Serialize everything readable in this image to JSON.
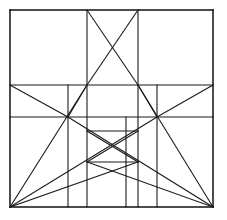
{
  "figure": {
    "title": "Geometric line construction diagram",
    "canvas": {
      "width": 227,
      "height": 220
    },
    "background_color": "#ffffff",
    "line_color": "#1a1a1a",
    "frame_color": "#111111",
    "line_width": 1.1,
    "frame_width": 1.5
  },
  "chart_data": {
    "type": "line",
    "title": "Geometric line construction diagram",
    "xlabel": "",
    "ylabel": "",
    "xlim": [
      0,
      227
    ],
    "ylim": [
      0,
      220
    ],
    "grid": false,
    "legend": "none",
    "bounds": {
      "left": 10,
      "top": 10,
      "right": 213,
      "bottom": 207
    },
    "vertical_rules": [
      10,
      68,
      87,
      126,
      138,
      157,
      213
    ],
    "horizontal_rules": [
      10,
      85,
      117,
      131,
      162,
      207
    ],
    "nodes": [
      {
        "name": "left-node",
        "x": 68,
        "y": 117
      },
      {
        "name": "right-node",
        "x": 157,
        "y": 117
      },
      {
        "name": "upper-left-node",
        "x": 87,
        "y": 85
      },
      {
        "name": "upper-right-node",
        "x": 138,
        "y": 85
      },
      {
        "name": "bottom-left-corner",
        "x": 10,
        "y": 207
      },
      {
        "name": "bottom-right-corner",
        "x": 213,
        "y": 207
      }
    ],
    "segments": [
      {
        "name": "frame-top",
        "x1": 10,
        "y1": 10,
        "x2": 213,
        "y2": 10,
        "kind": "frame"
      },
      {
        "name": "frame-right",
        "x1": 213,
        "y1": 10,
        "x2": 213,
        "y2": 207,
        "kind": "frame"
      },
      {
        "name": "frame-bottom",
        "x1": 10,
        "y1": 207,
        "x2": 213,
        "y2": 207,
        "kind": "frame"
      },
      {
        "name": "frame-left",
        "x1": 10,
        "y1": 10,
        "x2": 10,
        "y2": 207,
        "kind": "frame"
      },
      {
        "name": "horizontal-upper",
        "x1": 10,
        "y1": 85,
        "x2": 213,
        "y2": 85,
        "kind": "rule"
      },
      {
        "name": "horizontal-mid",
        "x1": 10,
        "y1": 117,
        "x2": 213,
        "y2": 117,
        "kind": "rule"
      },
      {
        "name": "vertical-left-inner",
        "x1": 68,
        "y1": 85,
        "x2": 68,
        "y2": 207,
        "kind": "rule"
      },
      {
        "name": "vertical-right-inner",
        "x1": 157,
        "y1": 85,
        "x2": 157,
        "y2": 207,
        "kind": "rule"
      },
      {
        "name": "vertical-upper-left",
        "x1": 87,
        "y1": 10,
        "x2": 87,
        "y2": 207,
        "kind": "rule"
      },
      {
        "name": "vertical-upper-right",
        "x1": 138,
        "y1": 10,
        "x2": 138,
        "y2": 207,
        "kind": "rule"
      },
      {
        "name": "vertical-core-left",
        "x1": 126,
        "y1": 117,
        "x2": 126,
        "y2": 207,
        "kind": "rule"
      },
      {
        "name": "upper-box-diagonal-a",
        "x1": 87,
        "y1": 10,
        "x2": 138,
        "y2": 85,
        "kind": "diagonal"
      },
      {
        "name": "upper-box-diagonal-b",
        "x1": 138,
        "y1": 10,
        "x2": 87,
        "y2": 85,
        "kind": "diagonal"
      },
      {
        "name": "inner-box-top",
        "x1": 87,
        "y1": 131,
        "x2": 138,
        "y2": 131,
        "kind": "rule"
      },
      {
        "name": "inner-box-bottom",
        "x1": 87,
        "y1": 162,
        "x2": 138,
        "y2": 162,
        "kind": "rule"
      },
      {
        "name": "inner-box-diagonal-a",
        "x1": 87,
        "y1": 131,
        "x2": 138,
        "y2": 162,
        "kind": "diagonal"
      },
      {
        "name": "inner-box-diagonal-b",
        "x1": 138,
        "y1": 131,
        "x2": 87,
        "y2": 162,
        "kind": "diagonal"
      },
      {
        "name": "node-to-upper-left",
        "x1": 68,
        "y1": 117,
        "x2": 87,
        "y2": 85,
        "kind": "diagonal"
      },
      {
        "name": "node-to-upper-right",
        "x1": 157,
        "y1": 117,
        "x2": 138,
        "y2": 85,
        "kind": "diagonal"
      },
      {
        "name": "left-node-ray-up",
        "x1": 68,
        "y1": 117,
        "x2": 10,
        "y2": 85,
        "kind": "diagonal"
      },
      {
        "name": "right-node-ray-up",
        "x1": 157,
        "y1": 117,
        "x2": 213,
        "y2": 85,
        "kind": "diagonal"
      },
      {
        "name": "bl-to-left-node-up",
        "x1": 10,
        "y1": 207,
        "x2": 87,
        "y2": 85,
        "kind": "diagonal"
      },
      {
        "name": "br-to-right-node-up",
        "x1": 213,
        "y1": 207,
        "x2": 138,
        "y2": 85,
        "kind": "diagonal"
      },
      {
        "name": "bl-to-right-node",
        "x1": 10,
        "y1": 207,
        "x2": 157,
        "y2": 117,
        "kind": "diagonal"
      },
      {
        "name": "br-to-left-node",
        "x1": 213,
        "y1": 207,
        "x2": 68,
        "y2": 117,
        "kind": "diagonal"
      },
      {
        "name": "bl-to-inner-right",
        "x1": 10,
        "y1": 207,
        "x2": 138,
        "y2": 162,
        "kind": "diagonal"
      },
      {
        "name": "br-to-inner-left",
        "x1": 213,
        "y1": 207,
        "x2": 87,
        "y2": 162,
        "kind": "diagonal"
      }
    ]
  }
}
